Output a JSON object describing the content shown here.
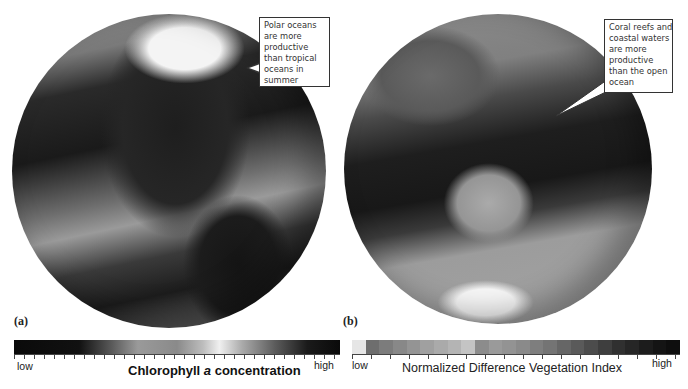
{
  "panels": [
    {
      "label": "(a)",
      "subject": "Ocean chlorophyll a (Americas / Pacific view)",
      "callout": {
        "lines": [
          "Polar oceans",
          "are more",
          "productive",
          "than tropical",
          "oceans in",
          "summer"
        ]
      },
      "scale": {
        "low": "low",
        "high": "high",
        "title_prefix": "Chlorophyll ",
        "title_italic": "a",
        "title_suffix": " concentration"
      }
    },
    {
      "label": "(b)",
      "subject": "Global productivity (Asia / Australia view)",
      "callout": {
        "lines": [
          "Coral reefs and",
          "coastal waters",
          "are more",
          "productive",
          "than the open",
          "ocean"
        ]
      },
      "scale": {
        "low": "low",
        "high": "high",
        "title": "Normalized Difference Vegetation Index",
        "swatches": [
          "#e6e6e6",
          "#6e6e6e",
          "#7c7c7c",
          "#888888",
          "#949494",
          "#a0a0a0",
          "#aaaaaa",
          "#b4b4b4",
          "#c4c4c4",
          "#8c8c8c",
          "#9a9a9a",
          "#939393",
          "#8a8a8a",
          "#7e7e7e",
          "#747474",
          "#666666",
          "#5a5a5a",
          "#4c4c4c",
          "#3e3e3e",
          "#303030",
          "#262626",
          "#1c1c1c",
          "#141414",
          "#0e0e0e"
        ]
      }
    }
  ]
}
